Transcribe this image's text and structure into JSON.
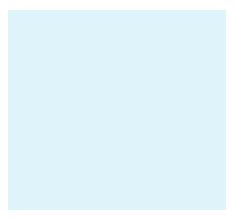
{
  "diagram": {
    "type": "go-board-fragment",
    "background": "#dff3fa",
    "line_color": "#2a2a2a",
    "edge_color": "#1a1a1a",
    "columns_x": [
      18,
      36,
      55,
      74,
      93,
      112,
      131,
      150,
      169,
      188,
      207
    ],
    "rows_y": [
      29,
      48,
      67,
      86,
      105,
      124,
      143,
      162,
      181,
      200
    ],
    "star_points": [
      [
        3,
        0
      ],
      [
        9,
        0
      ],
      [
        3,
        6
      ],
      [
        9,
        6
      ]
    ],
    "stones": [
      {
        "color": "white",
        "col": 1,
        "row": 1
      },
      {
        "color": "white",
        "col": 2,
        "row": 1
      },
      {
        "color": "white",
        "col": 3,
        "row": 1
      },
      {
        "color": "white",
        "col": 4,
        "row": 1
      },
      {
        "color": "white",
        "col": 5,
        "row": 1
      },
      {
        "color": "black",
        "col": 1,
        "row": 2
      },
      {
        "color": "black",
        "col": 2,
        "row": 2
      },
      {
        "color": "black",
        "col": 3,
        "row": 2
      },
      {
        "color": "black",
        "col": 4,
        "row": 2
      },
      {
        "color": "white",
        "col": 5,
        "row": 2
      },
      {
        "color": "black",
        "col": 1,
        "row": 3
      },
      {
        "color": "black",
        "col": 4,
        "row": 3
      },
      {
        "color": "white",
        "col": 5,
        "row": 3
      },
      {
        "color": "black",
        "col": 4,
        "row": 4
      },
      {
        "color": "white",
        "col": 5,
        "row": 4
      },
      {
        "color": "black",
        "col": 4,
        "row": 5
      },
      {
        "color": "white",
        "col": 5,
        "row": 5
      },
      {
        "color": "black",
        "col": 2,
        "row": 6
      },
      {
        "color": "black",
        "col": 4,
        "row": 6
      },
      {
        "color": "white",
        "col": 5,
        "row": 6
      },
      {
        "color": "black",
        "col": 3,
        "row": 7
      },
      {
        "color": "white",
        "col": 4,
        "row": 7
      },
      {
        "color": "white",
        "col": 6,
        "row": 7
      },
      {
        "color": "black",
        "col": 2,
        "row": 8
      },
      {
        "color": "white",
        "col": 3,
        "row": 8
      },
      {
        "color": "white",
        "col": 4,
        "row": 8
      }
    ],
    "labels": {
      "b": "B",
      "a": "A"
    }
  }
}
